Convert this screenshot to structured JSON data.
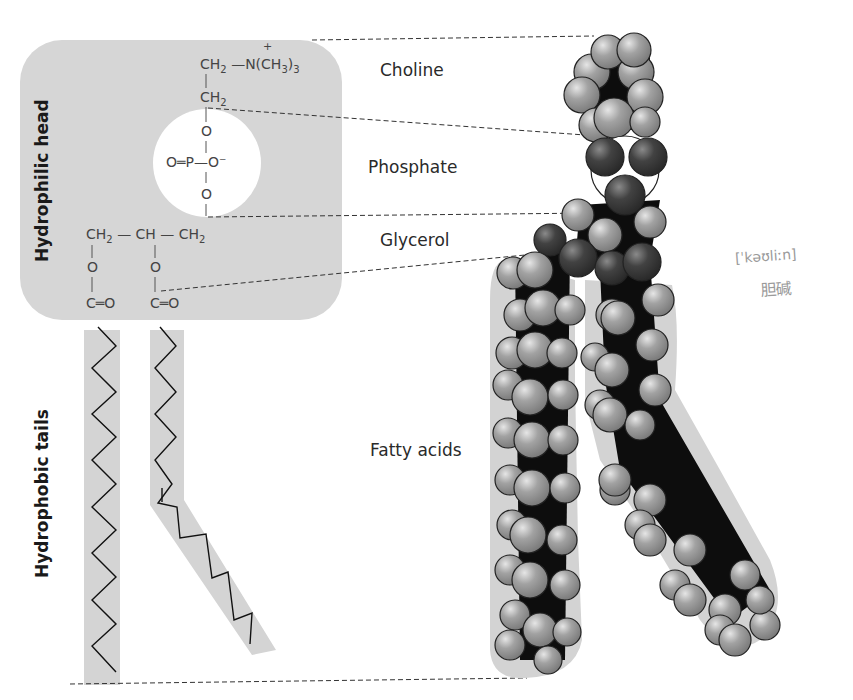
{
  "diagram": {
    "type": "phospholipid-structure",
    "side_labels": {
      "head": "Hydrophilic head",
      "tails": "Hydrophobic tails"
    },
    "region_labels": {
      "choline": "Choline",
      "phosphate": "Phosphate",
      "glycerol": "Glycerol",
      "fatty_acids": "Fatty acids"
    },
    "structural_formula": {
      "choline_top": "CH₂ — N(CH₃)₃",
      "choline_charge": "+",
      "choline_ch2": "CH₂",
      "phosphate_top_o": "O",
      "phosphate_center": "O═P—O⁻",
      "phosphate_bottom_o": "O",
      "glycerol_chain": "CH₂ — CH — CH₂",
      "ester_o_left": "O",
      "ester_o_right": "O",
      "carbonyl_left": "C═O",
      "carbonyl_right": "C═O"
    },
    "handwritten_note": {
      "phonetic": "[ˈkəʊliːn]",
      "chinese": "胆碱"
    },
    "colors": {
      "head_box": "#d6d6d6",
      "tail_band": "#d4d4d4",
      "phosphate_circle": "#ffffff",
      "atom_light": "#9c9c9c",
      "atom_dark": "#3c3c3c",
      "bond_black": "#0d0d0d"
    }
  }
}
